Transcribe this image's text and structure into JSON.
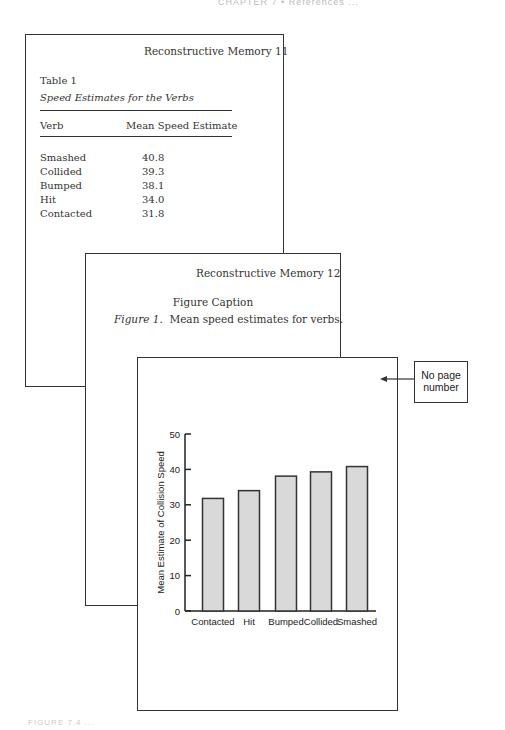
{
  "running_head": "CHAPTER 7 • References ...",
  "page1": {
    "header": "Reconstructive Memory  11",
    "table_label": "Table 1",
    "table_title": "Speed Estimates for the Verbs",
    "columns": [
      "Verb",
      "Mean Speed Estimate"
    ],
    "rows": [
      {
        "verb": "Smashed",
        "value": "40.8"
      },
      {
        "verb": "Collided",
        "value": "39.3"
      },
      {
        "verb": "Bumped",
        "value": "38.1"
      },
      {
        "verb": "Hit",
        "value": "34.0"
      },
      {
        "verb": "Contacted",
        "value": "31.8"
      }
    ]
  },
  "page2": {
    "header": "Reconstructive Memory  12",
    "caption_title": "Figure Caption",
    "caption_label": "Figure 1.",
    "caption_text": "Mean speed estimates for verbs."
  },
  "page3": {
    "callout": "No page number"
  },
  "chart_data": {
    "type": "bar",
    "title": "",
    "xlabel": "",
    "ylabel": "Mean Estimate of Collision Speed",
    "categories": [
      "Contacted",
      "Hit",
      "Bumped",
      "Collided",
      "Smashed"
    ],
    "values": [
      31.8,
      34.0,
      38.1,
      39.3,
      40.8
    ],
    "ylim": [
      0,
      50
    ],
    "yticks": [
      0,
      10,
      20,
      30,
      40,
      50
    ],
    "grid": false,
    "legend": null,
    "bar_color": "#d9d9d9",
    "bar_edge_color": "#333333"
  },
  "footer_caption": "FIGURE 7.4 ..."
}
